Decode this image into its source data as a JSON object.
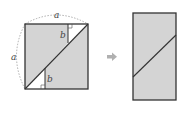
{
  "diagram": {
    "type": "geometric-dissection",
    "left_figure": {
      "shape": "square",
      "side_label": "a",
      "top_label": "a",
      "left_label": "a",
      "segment_label_top": "b",
      "segment_label_bottom": "b",
      "fill_color": "#d4d4d4",
      "stroke_color": "#333333"
    },
    "arrow": {
      "direction": "right",
      "color": "#b0b0b0"
    },
    "right_figure": {
      "shape": "rectangle",
      "fill_color": "#d4d4d4",
      "stroke_color": "#333333"
    }
  }
}
